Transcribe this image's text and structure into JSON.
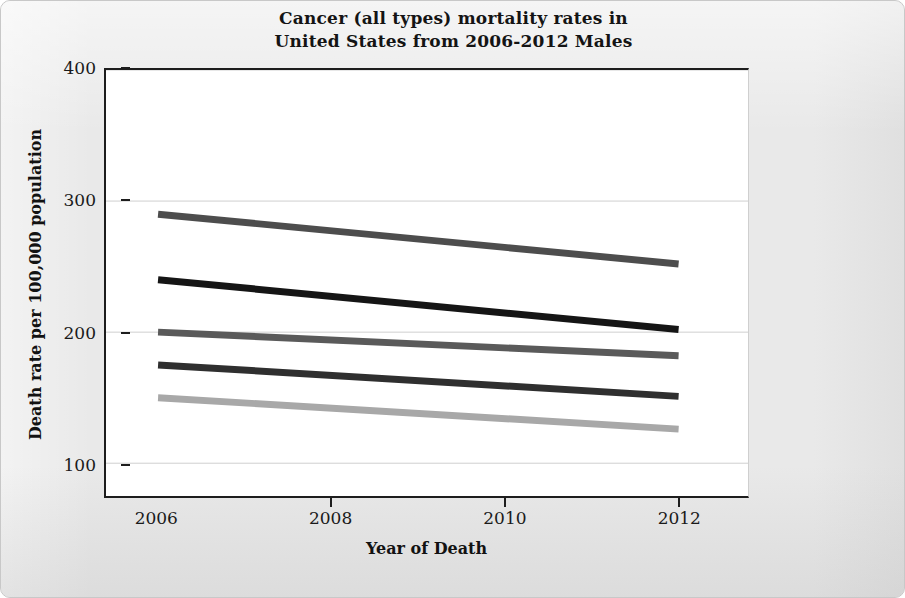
{
  "chart_data": {
    "type": "line",
    "title": "Cancer (all types) mortality rates in\nUnited States from 2006-2012 Males",
    "xlabel": "Year of Death",
    "ylabel": "Death rate per 100,000 population",
    "x": [
      2006,
      2012
    ],
    "xlim": [
      2005.4,
      2012.8
    ],
    "ylim": [
      75,
      400
    ],
    "xticks": [
      2006,
      2008,
      2010,
      2012
    ],
    "xtick_labels": [
      "2006",
      "2008",
      "2010",
      "2012"
    ],
    "yticks": [
      100,
      200,
      300,
      400
    ],
    "ytick_labels": [
      "100",
      "200",
      "300",
      "400"
    ],
    "grid": "horizontal",
    "legend": "none",
    "series": [
      {
        "name": "series-1",
        "values": [
          290,
          252
        ],
        "color": "#4d4d4d",
        "width": 7
      },
      {
        "name": "series-2",
        "values": [
          240,
          202
        ],
        "color": "#151515",
        "width": 7
      },
      {
        "name": "series-3",
        "values": [
          200,
          182
        ],
        "color": "#5a5a5a",
        "width": 7
      },
      {
        "name": "series-4",
        "values": [
          175,
          151
        ],
        "color": "#2f2f2f",
        "width": 7
      },
      {
        "name": "series-5",
        "values": [
          150,
          126
        ],
        "color": "#a8a8a8",
        "width": 7
      }
    ]
  },
  "style": {
    "figure_background": "#e9e9e9",
    "plot_background": "#ffffff",
    "axis_color": "#1d1d1d",
    "grid_color": "#cfcfcf",
    "text_color": "#141414"
  }
}
